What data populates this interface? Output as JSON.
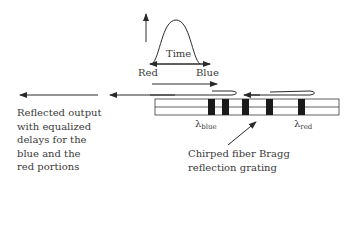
{
  "pulse": {
    "time_label": "Time",
    "red_label": "Red",
    "blue_label": "Blue"
  },
  "output": {
    "lines": [
      "Reflected output",
      "with equalized",
      "delays for the",
      "blue and the",
      "red portions"
    ]
  },
  "grating": {
    "label_lines": [
      "Chirped fiber Bragg",
      "reflection grating"
    ],
    "lambda_blue": {
      "symbol": "λ",
      "sub": "blue"
    },
    "lambda_red": {
      "symbol": "λ",
      "sub": "red"
    }
  },
  "colors": {
    "line": "#2a2a2a",
    "grating_block": "#1a1a1a",
    "fiber_edge": "#3a3a3a"
  }
}
